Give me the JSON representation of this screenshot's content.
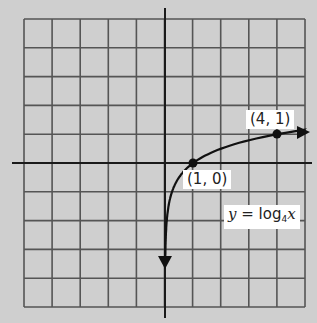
{
  "chart_data": {
    "type": "line",
    "title": "",
    "function": "y = log_4 x",
    "xlabel": "",
    "ylabel": "",
    "grid": true,
    "grid_cells": {
      "columns": 10,
      "rows": 10
    },
    "xlim": [
      -5,
      5
    ],
    "ylim": [
      -5,
      5
    ],
    "series": [
      {
        "name": "y = log4 x",
        "x": [
          0.0625,
          0.125,
          0.25,
          0.5,
          1,
          2,
          4,
          5
        ],
        "y": [
          -2,
          -1.5,
          -1,
          -0.5,
          0,
          0.5,
          1,
          1.16
        ]
      }
    ],
    "points": [
      {
        "x": 1,
        "y": 0,
        "label": "(1, 0)"
      },
      {
        "x": 4,
        "y": 1,
        "label": "(4, 1)"
      }
    ],
    "annotations": [
      {
        "text": "y = log4 x"
      }
    ]
  },
  "labels": {
    "point_a": "(1, 0)",
    "point_b": "(4, 1)",
    "eq_y": "y",
    "eq_eq": " = log",
    "eq_base": "4",
    "eq_x": "x"
  },
  "colors": {
    "background": "#cfcfcf",
    "grid": "#555555",
    "axis": "#1a1a1a",
    "curve": "#111111",
    "label_bg": "#ffffff"
  }
}
